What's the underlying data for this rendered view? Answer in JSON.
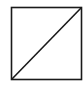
{
  "diagram": {
    "background": "#ffffff",
    "stroke_color": "#1a1a1a",
    "stroke_width": 1.6,
    "square": {
      "x": 11.5,
      "y": 7.5,
      "width": 70,
      "height": 72
    },
    "diagonal": {
      "x1": 11.5,
      "y1": 79.5,
      "x2": 81.5,
      "y2": 7.5,
      "direction": "bottom-left-to-top-right"
    }
  }
}
